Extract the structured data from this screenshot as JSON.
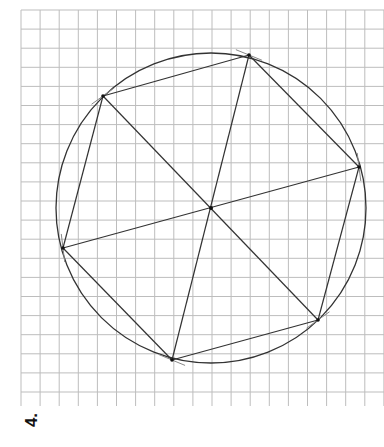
{
  "problem_label": "4.",
  "grid": {
    "x0": 21,
    "y0": 10,
    "x1": 384,
    "y1": 406,
    "cols": 19,
    "rows": 21,
    "cell": 19.1,
    "color": "#bdbdbd"
  },
  "circle": {
    "cx": 211,
    "cy": 208,
    "r": 155,
    "color": "#333333"
  },
  "center": {
    "x": 211,
    "y": 208
  },
  "hexagon_vertices": [
    {
      "name": "A",
      "x": 103,
      "y": 96
    },
    {
      "name": "B",
      "x": 249,
      "y": 55
    },
    {
      "name": "C",
      "x": 359,
      "y": 167
    },
    {
      "name": "D",
      "x": 318,
      "y": 320
    },
    {
      "name": "E",
      "x": 172,
      "y": 360
    },
    {
      "name": "F",
      "x": 63,
      "y": 248
    }
  ],
  "diagonals": [
    [
      "A",
      "D"
    ],
    [
      "B",
      "E"
    ],
    [
      "C",
      "F"
    ]
  ],
  "line_color": "#333333",
  "arc_mark_color": "#888888"
}
